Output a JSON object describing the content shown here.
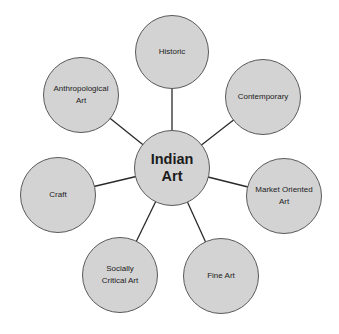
{
  "diagram": {
    "type": "hub-and-spoke",
    "center": {
      "label_line1": "Indian",
      "label_line2": "Art",
      "cx": 172,
      "cy": 168,
      "r": 38
    },
    "nodes": [
      {
        "id": "historic",
        "line1": "Historic",
        "line2": "",
        "cx": 172,
        "cy": 52,
        "r": 37
      },
      {
        "id": "contemporary",
        "line1": "Contemporary",
        "line2": "",
        "cx": 263,
        "cy": 97,
        "r": 38
      },
      {
        "id": "market-oriented-art",
        "line1": "Market Oriented",
        "line2": "Art",
        "cx": 284,
        "cy": 196,
        "r": 38
      },
      {
        "id": "fine-art",
        "line1": "Fine Art",
        "line2": "",
        "cx": 221,
        "cy": 276,
        "r": 38
      },
      {
        "id": "socially-critical-art",
        "line1": "Socially",
        "line2": "Critical Art",
        "cx": 120,
        "cy": 275,
        "r": 38
      },
      {
        "id": "craft",
        "line1": "Craft",
        "line2": "",
        "cx": 58,
        "cy": 195,
        "r": 38
      },
      {
        "id": "anthropological-art",
        "line1": "Anthropological",
        "line2": "Art",
        "cx": 81,
        "cy": 95,
        "r": 38
      }
    ],
    "colors": {
      "node_fill": "#d3d3d3",
      "node_stroke": "#5a5a5a",
      "line": "#2a2a2a",
      "text": "#222222",
      "background": "#ffffff"
    }
  }
}
